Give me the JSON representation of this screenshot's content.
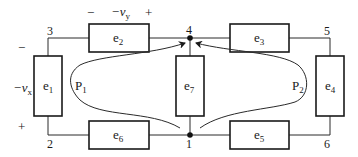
{
  "diagram": {
    "type": "circuit-graph",
    "nodes": [
      {
        "id": "1",
        "label": "1"
      },
      {
        "id": "2",
        "label": "2"
      },
      {
        "id": "3",
        "label": "3"
      },
      {
        "id": "4",
        "label": "4"
      },
      {
        "id": "5",
        "label": "5"
      },
      {
        "id": "6",
        "label": "6"
      }
    ],
    "elements": [
      {
        "id": "e1",
        "label": "e",
        "sub": "1",
        "from": "3",
        "to": "2"
      },
      {
        "id": "e2",
        "label": "e",
        "sub": "2",
        "from": "3",
        "to": "4"
      },
      {
        "id": "e3",
        "label": "e",
        "sub": "3",
        "from": "4",
        "to": "5"
      },
      {
        "id": "e4",
        "label": "e",
        "sub": "4",
        "from": "5",
        "to": "6"
      },
      {
        "id": "e5",
        "label": "e",
        "sub": "5",
        "from": "1",
        "to": "6"
      },
      {
        "id": "e6",
        "label": "e",
        "sub": "6",
        "from": "2",
        "to": "1"
      },
      {
        "id": "e7",
        "label": "e",
        "sub": "7",
        "from": "1",
        "to": "4"
      }
    ],
    "voltages": {
      "vx": {
        "prefix": "−v",
        "sub": "x",
        "plus": "+",
        "minus": "−"
      },
      "vy": {
        "prefix": "−v",
        "sub": "y",
        "plus": "+",
        "minus": "−"
      }
    },
    "paths": [
      {
        "id": "P1",
        "label": "P",
        "sub": "1"
      },
      {
        "id": "P2",
        "label": "P",
        "sub": "2"
      }
    ]
  }
}
